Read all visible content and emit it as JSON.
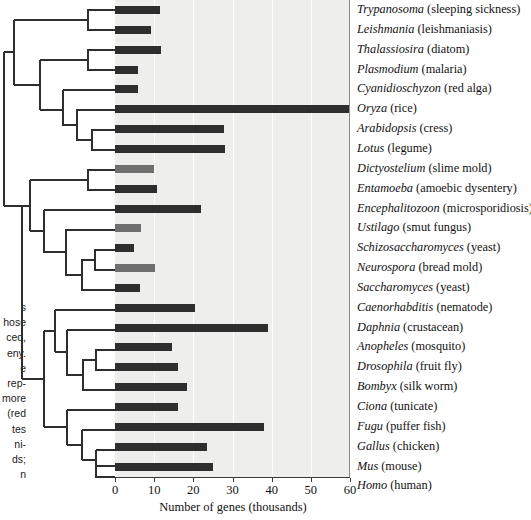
{
  "chart_data": {
    "type": "bar",
    "title": "",
    "xlabel": "Number of genes (thousands)",
    "ylabel": "",
    "xlim": [
      0,
      60
    ],
    "xticks": [
      0,
      10,
      20,
      30,
      40,
      50,
      60
    ],
    "orientation": "horizontal",
    "grid": true,
    "legend": null,
    "categories": [
      "Trypanosoma",
      "Leishmania",
      "Thalassiosira",
      "Plasmodium",
      "Cyanidioschyzon",
      "Oryza",
      "Arabidopsis",
      "Lotus",
      "Dictyostelium",
      "Entamoeba",
      "Encephalitozoon",
      "Ustilago",
      "Schizosaccharomyces",
      "Neurospora",
      "Saccharomyces",
      "Caenorhabditis",
      "Daphnia",
      "Anopheles",
      "Drosophila",
      "Bombyx",
      "Ciona",
      "Fugu",
      "Gallus",
      "Mus",
      "Homo"
    ],
    "values": [
      11.5,
      9.3,
      11.8,
      5.9,
      5.9,
      60,
      27.8,
      28.2,
      10.0,
      10.8,
      22.0,
      6.6,
      4.9,
      10.1,
      6.3,
      20.5,
      39.0,
      14.5,
      16.0,
      18.5,
      16.0,
      38.0,
      23.5,
      25.0,
      25.0
    ],
    "rows": [
      {
        "genus": "Trypanosoma",
        "common": "(sleeping sickness)",
        "value": 11.5,
        "shade": "dark"
      },
      {
        "genus": "Leishmania",
        "common": "(leishmaniasis)",
        "value": 9.3,
        "shade": "dark"
      },
      {
        "genus": "Thalassiosira",
        "common": "(diatom)",
        "value": 11.8,
        "shade": "dark"
      },
      {
        "genus": "Plasmodium",
        "common": "(malaria)",
        "value": 5.9,
        "shade": "dark"
      },
      {
        "genus": "Cyanidioschyzon",
        "common": "(red alga)",
        "value": 5.9,
        "shade": "dark"
      },
      {
        "genus": "Oryza",
        "common": "(rice)",
        "value": 60,
        "shade": "dark"
      },
      {
        "genus": "Arabidopsis",
        "common": "(cress)",
        "value": 27.8,
        "shade": "dark"
      },
      {
        "genus": "Lotus",
        "common": "(legume)",
        "value": 28.2,
        "shade": "dark"
      },
      {
        "genus": "Dictyostelium",
        "common": "(slime mold)",
        "value": 10.0,
        "shade": "mid"
      },
      {
        "genus": "Entamoeba",
        "common": "(amoebic dysentery)",
        "value": 10.8,
        "shade": "dark"
      },
      {
        "genus": "Encephalitozoon",
        "common": "(microsporidiosis)",
        "value": 22.0,
        "shade": "dark"
      },
      {
        "genus": "Ustilago",
        "common": "(smut fungus)",
        "value": 6.6,
        "shade": "mid"
      },
      {
        "genus": "Schizosaccharomyces",
        "common": "(yeast)",
        "value": 4.9,
        "shade": "dark"
      },
      {
        "genus": "Neurospora",
        "common": "(bread mold)",
        "value": 10.1,
        "shade": "mid"
      },
      {
        "genus": "Saccharomyces",
        "common": "(yeast)",
        "value": 6.3,
        "shade": "dark"
      },
      {
        "genus": "Caenorhabditis",
        "common": "(nematode)",
        "value": 20.5,
        "shade": "dark"
      },
      {
        "genus": "Daphnia",
        "common": "(crustacean)",
        "value": 39.0,
        "shade": "dark"
      },
      {
        "genus": "Anopheles",
        "common": "(mosquito)",
        "value": 14.5,
        "shade": "dark"
      },
      {
        "genus": "Drosophila",
        "common": "(fruit fly)",
        "value": 16.0,
        "shade": "dark"
      },
      {
        "genus": "Bombyx",
        "common": "(silk worm)",
        "value": 18.5,
        "shade": "dark"
      },
      {
        "genus": "Ciona",
        "common": "(tunicate)",
        "value": 16.0,
        "shade": "dark"
      },
      {
        "genus": "Fugu",
        "common": "(puffer fish)",
        "value": 38.0,
        "shade": "dark"
      },
      {
        "genus": "Gallus",
        "common": "(chicken)",
        "value": 23.5,
        "shade": "dark"
      },
      {
        "genus": "Mus",
        "common": "(mouse)",
        "value": 25.0,
        "shade": "dark"
      },
      {
        "genus": "Homo",
        "common": "(human)",
        "value": 25.0,
        "shade": "dark"
      }
    ]
  },
  "colors": {
    "panel_background": "#eeeeec",
    "bar_dark": "#2e2e2e",
    "bar_mid": "#6e6e6e",
    "gridline": "#fdfdfc",
    "axis": "#3a3a3a",
    "text": "#111111",
    "tree_line": "#2e2e2e"
  },
  "axis": {
    "title": "Number of genes (thousands)",
    "ticklabels": [
      "0",
      "10",
      "20",
      "30",
      "40",
      "50",
      "60"
    ]
  },
  "caption_fragment": {
    "lines": [
      "s",
      "hose",
      "ced,",
      "eny.",
      "e",
      "rep-",
      "more",
      "(red",
      "tes",
      "ni-",
      "ds;",
      "n"
    ]
  }
}
